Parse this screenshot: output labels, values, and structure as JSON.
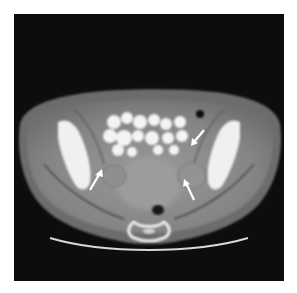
{
  "image": {
    "modality": "CT",
    "view": "axial pelvis",
    "annotations": [
      {
        "type": "arrow",
        "position": "left adnexa",
        "color": "#ffffff"
      },
      {
        "type": "arrow",
        "position": "right adnexa",
        "color": "#ffffff"
      },
      {
        "type": "arrow",
        "position": "right upper adnexa",
        "color": "#ffffff"
      }
    ]
  },
  "colors": {
    "background": "#0d0d0d",
    "soft_tissue": "#8a8a8a",
    "fat": "#5a5a5a",
    "bone": "#f2f2f2",
    "contrast_bowel": "#f5f5f5"
  }
}
